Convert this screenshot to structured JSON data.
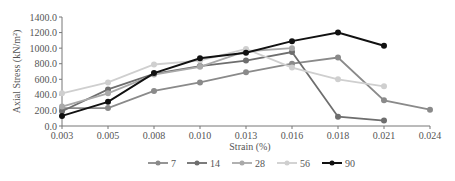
{
  "chart_data": {
    "type": "line",
    "title": "",
    "xlabel": "Strain (%)",
    "ylabel": "Axial Stress (kN/m²)",
    "x": [
      "0.003",
      "0.005",
      "0.008",
      "0.010",
      "0.013",
      "0.016",
      "0.018",
      "0.021",
      "0.024"
    ],
    "yticks": [
      "0.0",
      "200.0",
      "400.0",
      "600.0",
      "800.0",
      "1000.0",
      "1200.0",
      "1400.0"
    ],
    "ylim": [
      0,
      1400
    ],
    "grid": false,
    "legend_position": "bottom",
    "series": [
      {
        "name": "7",
        "color": "#8a8a8a",
        "values": [
          230,
          230,
          450,
          560,
          690,
          800,
          880,
          330,
          210
        ]
      },
      {
        "name": "14",
        "color": "#6e6e6e",
        "values": [
          190,
          470,
          670,
          770,
          840,
          950,
          120,
          70,
          null
        ]
      },
      {
        "name": "28",
        "color": "#a9a9a9",
        "values": [
          250,
          420,
          660,
          760,
          960,
          1000,
          null,
          null,
          null
        ]
      },
      {
        "name": "56",
        "color": "#cfcfcf",
        "values": [
          420,
          560,
          790,
          840,
          990,
          750,
          600,
          510,
          null
        ]
      },
      {
        "name": "90",
        "color": "#111111",
        "values": [
          130,
          310,
          680,
          870,
          940,
          1090,
          1200,
          1030,
          null
        ]
      }
    ]
  }
}
